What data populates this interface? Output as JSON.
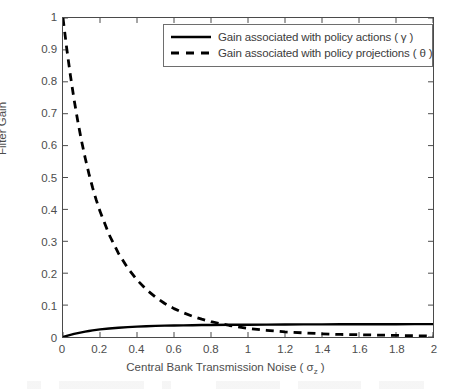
{
  "chart_data": {
    "type": "line",
    "title": "",
    "xlabel": "Central Bank Transmission Noise ( σz )",
    "xlabel_main": "Central Bank Transmission Noise ( ",
    "xlabel_symbol": "σ",
    "xlabel_subscript": "z",
    "xlabel_close": " )",
    "ylabel": "Filter Gain",
    "xlim": [
      0,
      2
    ],
    "ylim": [
      0,
      1
    ],
    "grid": false,
    "box": true,
    "legend_position": "top-right",
    "xticks": [
      "0",
      "0.2",
      "0.4",
      "0.6",
      "0.8",
      "1",
      "1.2",
      "1.4",
      "1.6",
      "1.8",
      "2"
    ],
    "xtick_values": [
      0,
      0.2,
      0.4,
      0.6,
      0.8,
      1,
      1.2,
      1.4,
      1.6,
      1.8,
      2
    ],
    "yticks": [
      "0",
      "0.1",
      "0.2",
      "0.3",
      "0.4",
      "0.5",
      "0.6",
      "0.7",
      "0.8",
      "0.9",
      "1"
    ],
    "ytick_values": [
      0,
      0.1,
      0.2,
      0.3,
      0.4,
      0.5,
      0.6,
      0.7,
      0.8,
      0.9,
      1
    ],
    "x": [
      0,
      0.02,
      0.04,
      0.06,
      0.08,
      0.1,
      0.12,
      0.14,
      0.16,
      0.18,
      0.2,
      0.25,
      0.3,
      0.35,
      0.4,
      0.45,
      0.5,
      0.55,
      0.6,
      0.65,
      0.7,
      0.75,
      0.8,
      0.9,
      1.0,
      1.1,
      1.2,
      1.3,
      1.4,
      1.5,
      1.6,
      1.7,
      1.8,
      1.9,
      2.0
    ],
    "series": [
      {
        "name": "Gain associated with policy actions ( γ )",
        "label_text": "Gain associated with policy actions ( γ )",
        "style": "solid",
        "color": "#000000",
        "values": [
          0,
          0.0035,
          0.0067,
          0.0096,
          0.0122,
          0.0146,
          0.0168,
          0.0188,
          0.0206,
          0.0222,
          0.0237,
          0.0268,
          0.0292,
          0.0311,
          0.0326,
          0.0338,
          0.0347,
          0.0355,
          0.0361,
          0.0366,
          0.037,
          0.0374,
          0.0377,
          0.0382,
          0.0386,
          0.0389,
          0.0392,
          0.0394,
          0.0396,
          0.0398,
          0.0399,
          0.04,
          0.0401,
          0.0402,
          0.0403
        ]
      },
      {
        "name": "Gain associated with policy projections ( θ )",
        "label_text": "Gain associated with policy projections ( θ )",
        "style": "dashed",
        "color": "#000000",
        "values": [
          1.0,
          0.905,
          0.82,
          0.744,
          0.676,
          0.615,
          0.561,
          0.512,
          0.468,
          0.429,
          0.394,
          0.32,
          0.262,
          0.216,
          0.179,
          0.149,
          0.125,
          0.105,
          0.089,
          0.076,
          0.065,
          0.056,
          0.048,
          0.036,
          0.027,
          0.021,
          0.016,
          0.013,
          0.01,
          0.008,
          0.007,
          0.006,
          0.005,
          0.004,
          0.003
        ]
      }
    ]
  },
  "legend": {
    "entries": [
      {
        "label": "Gain associated with policy actions ( γ )",
        "style": "solid"
      },
      {
        "label": "Gain associated with policy projections ( θ )",
        "style": "dashed"
      }
    ]
  }
}
